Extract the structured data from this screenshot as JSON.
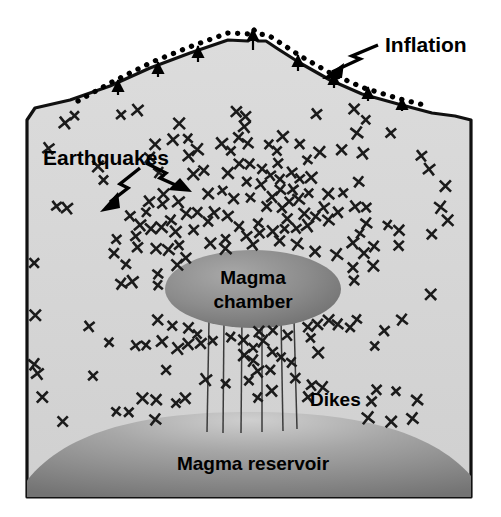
{
  "figure": {
    "background_color": "#ffffff"
  },
  "colors": {
    "rock_fill": "#d6d6d6",
    "rock_outline": "#111111",
    "magma_chamber_dark": "#737373",
    "magma_chamber_light": "#a8a8a8",
    "magma_reservoir_dark": "#787878",
    "magma_reservoir_light": "#c2c2c2",
    "dike_line": "#3a3a3a",
    "marker_color": "#1a1a1a",
    "label_color": "#000000",
    "dotted_line_color": "#000000"
  },
  "labels": {
    "inflation": "Inflation",
    "earthquakes": "Earthquakes",
    "magma_chamber_line1": "Magma",
    "magma_chamber_line2": "chamber",
    "dikes": "Dikes",
    "magma_reservoir": "Magma reservoir"
  },
  "annotations": {
    "inflation_arrow": "arrow pointing down-left from Inflation label to dotted surface line",
    "earthquake_arrow_left": "lightning arrow pointing down-left into earthquake swarm",
    "earthquake_arrow_right": "lightning arrow pointing down-right into earthquake swarm",
    "uplift_arrows_count": 9,
    "dike_count": 6,
    "earthquake_marker_count": 208,
    "earthquake_marker_glyph": "x"
  },
  "geometry": {
    "block_left_x": 27,
    "block_right_x": 471,
    "block_bottom_y": 497,
    "summit_x": 253,
    "summit_y": 38,
    "chamber_center_x": 253,
    "chamber_center_y": 289,
    "chamber_rx": 88,
    "chamber_ry": 38,
    "reservoir_top_y": 415,
    "dike_top_y": 320,
    "dike_bottom_y": 432
  },
  "chart_data": {
    "type": "diagram",
    "elements": [
      {
        "name": "Inflation",
        "kind": "dotted-surface-offset",
        "description": "dotted line above volcano flank showing ground surface uplift"
      },
      {
        "name": "Earthquakes",
        "kind": "point-swarm",
        "description": "x markers dense around and above the magma chamber, sparse at the edges",
        "count": 208
      },
      {
        "name": "Magma chamber",
        "kind": "ellipse",
        "center": [
          253,
          289
        ],
        "radii": [
          88,
          38
        ]
      },
      {
        "name": "Dikes",
        "kind": "vertical-lines",
        "count": 6,
        "span_y": [
          320,
          432
        ]
      },
      {
        "name": "Magma reservoir",
        "kind": "dome",
        "top_y": 415
      }
    ]
  }
}
